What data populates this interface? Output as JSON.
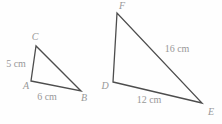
{
  "figure": {
    "background_color": "#fefefe",
    "stroke_color": "#4d4d4d",
    "label_color": "#989898",
    "canvas": {
      "width": 222,
      "height": 124
    },
    "triangles": [
      {
        "name": "triangle-ABC",
        "vertices": [
          {
            "label": "A",
            "x": 31,
            "y": 81,
            "label_x": 26,
            "label_y": 89
          },
          {
            "label": "B",
            "x": 81,
            "y": 91,
            "label_x": 84,
            "label_y": 101
          },
          {
            "label": "C",
            "x": 36,
            "y": 46,
            "label_x": 35,
            "label_y": 40
          }
        ],
        "side_labels": [
          {
            "text": "5 cm",
            "x": 16,
            "y": 67
          },
          {
            "text": "6 cm",
            "x": 47,
            "y": 100
          }
        ]
      },
      {
        "name": "triangle-DEF",
        "vertices": [
          {
            "label": "D",
            "x": 113,
            "y": 82,
            "label_x": 105,
            "label_y": 89
          },
          {
            "label": "E",
            "x": 202,
            "y": 103,
            "label_x": 211,
            "label_y": 115
          },
          {
            "label": "F",
            "x": 117,
            "y": 13,
            "label_x": 122,
            "label_y": 9
          }
        ],
        "side_labels": [
          {
            "text": "16 cm",
            "x": 177,
            "y": 52
          },
          {
            "text": "12 cm",
            "x": 149,
            "y": 103
          }
        ]
      }
    ],
    "vertex_font_size": 10,
    "side_label_font_size": 10,
    "stroke_width": 1.3
  }
}
